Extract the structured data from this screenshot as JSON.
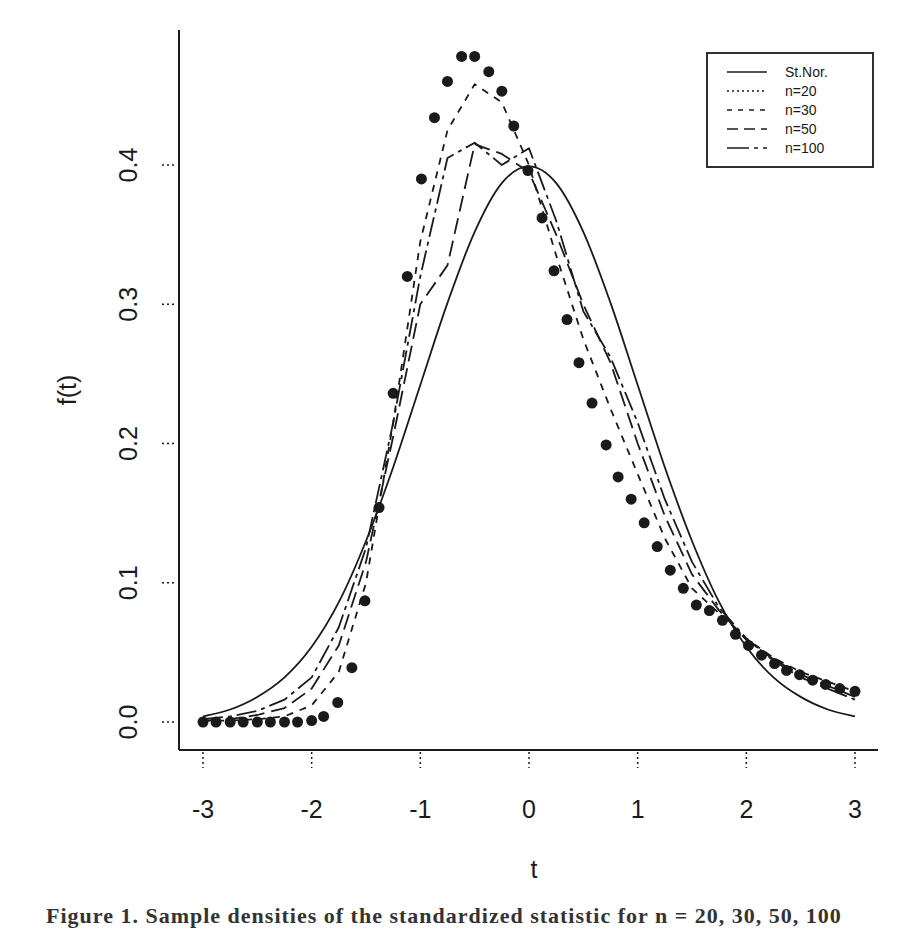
{
  "chart_data": {
    "type": "line",
    "title": "",
    "xlabel": "t",
    "ylabel": "f(t)",
    "xlim": [
      -3,
      3
    ],
    "ylim": [
      0.0,
      0.5
    ],
    "grid": false,
    "legend_position": "top-right",
    "x_ticks": [
      "-3",
      "-2",
      "-1",
      "0",
      "1",
      "2",
      "3"
    ],
    "y_ticks": [
      "0.0",
      "0.1",
      "0.2",
      "0.3",
      "0.4"
    ],
    "x": [
      -3.0,
      -2.75,
      -2.5,
      -2.25,
      -2.0,
      -1.75,
      -1.5,
      -1.25,
      -1.0,
      -0.75,
      -0.5,
      -0.25,
      0.0,
      0.25,
      0.5,
      0.75,
      1.0,
      1.25,
      1.5,
      1.75,
      2.0,
      2.25,
      2.5,
      2.75,
      3.0
    ],
    "series": [
      {
        "name": "St.Nor.",
        "style": "solid",
        "values": [
          0.004,
          0.009,
          0.018,
          0.032,
          0.054,
          0.086,
          0.13,
          0.183,
          0.242,
          0.301,
          0.352,
          0.387,
          0.399,
          0.387,
          0.352,
          0.301,
          0.242,
          0.183,
          0.13,
          0.086,
          0.054,
          0.032,
          0.018,
          0.009,
          0.004
        ]
      },
      {
        "name": "n=20",
        "style": "points",
        "x": [
          -3.0,
          -2.88,
          -2.75,
          -2.63,
          -2.5,
          -2.38,
          -2.25,
          -2.13,
          -2.0,
          -1.89,
          -1.76,
          -1.63,
          -1.51,
          -1.38,
          -1.25,
          -1.12,
          -0.99,
          -0.87,
          -0.75,
          -0.62,
          -0.5,
          -0.37,
          -0.25,
          -0.14,
          -0.01,
          0.12,
          0.23,
          0.35,
          0.46,
          0.58,
          0.71,
          0.82,
          0.94,
          1.06,
          1.18,
          1.3,
          1.42,
          1.54,
          1.66,
          1.78,
          1.9,
          2.02,
          2.14,
          2.26,
          2.37,
          2.49,
          2.61,
          2.73,
          2.86,
          3.0
        ],
        "values": [
          0.0,
          0.0,
          0.0,
          0.0,
          0.0,
          0.0,
          0.0,
          0.0,
          0.001,
          0.004,
          0.014,
          0.039,
          0.087,
          0.154,
          0.236,
          0.32,
          0.39,
          0.434,
          0.46,
          0.478,
          0.478,
          0.467,
          0.453,
          0.428,
          0.396,
          0.362,
          0.324,
          0.289,
          0.258,
          0.229,
          0.199,
          0.176,
          0.16,
          0.143,
          0.126,
          0.109,
          0.096,
          0.084,
          0.08,
          0.073,
          0.063,
          0.055,
          0.048,
          0.042,
          0.037,
          0.034,
          0.03,
          0.027,
          0.024,
          0.022
        ]
      },
      {
        "name": "n=30",
        "style": "short-dash",
        "values": [
          0.001,
          0.001,
          0.002,
          0.004,
          0.012,
          0.036,
          0.1,
          0.215,
          0.345,
          0.425,
          0.458,
          0.445,
          0.4,
          0.335,
          0.275,
          0.225,
          0.178,
          0.132,
          0.096,
          0.078,
          0.06,
          0.046,
          0.036,
          0.029,
          0.022
        ]
      },
      {
        "name": "n=50",
        "style": "long-dash",
        "values": [
          0.001,
          0.002,
          0.005,
          0.01,
          0.024,
          0.055,
          0.115,
          0.205,
          0.3,
          0.328,
          0.415,
          0.408,
          0.395,
          0.35,
          0.3,
          0.258,
          0.2,
          0.148,
          0.106,
          0.08,
          0.059,
          0.045,
          0.034,
          0.026,
          0.018
        ]
      },
      {
        "name": "n=100",
        "style": "dash-dot",
        "values": [
          0.002,
          0.004,
          0.008,
          0.016,
          0.032,
          0.068,
          0.125,
          0.215,
          0.32,
          0.405,
          0.416,
          0.4,
          0.412,
          0.36,
          0.295,
          0.262,
          0.215,
          0.16,
          0.115,
          0.082,
          0.06,
          0.044,
          0.032,
          0.024,
          0.016
        ]
      }
    ]
  },
  "axes": {
    "x_label": "t",
    "y_label": "f(t)",
    "x_ticks": [
      {
        "label": "-3",
        "value": -3
      },
      {
        "label": "-2",
        "value": -2
      },
      {
        "label": "-1",
        "value": -1
      },
      {
        "label": "0",
        "value": 0
      },
      {
        "label": "1",
        "value": 1
      },
      {
        "label": "2",
        "value": 2
      },
      {
        "label": "3",
        "value": 3
      }
    ],
    "y_ticks": [
      {
        "label": "0.0",
        "value": 0.0
      },
      {
        "label": "0.1",
        "value": 0.1
      },
      {
        "label": "0.2",
        "value": 0.2
      },
      {
        "label": "0.3",
        "value": 0.3
      },
      {
        "label": "0.4",
        "value": 0.4
      }
    ]
  },
  "legend": {
    "items": [
      {
        "label": "St.Nor.",
        "style": "solid"
      },
      {
        "label": "n=20",
        "style": "dotted"
      },
      {
        "label": "n=30",
        "style": "short-dash"
      },
      {
        "label": "n=50",
        "style": "long-dash"
      },
      {
        "label": "n=100",
        "style": "dash-dot"
      }
    ]
  },
  "colors": {
    "ink": "#1a1a1a",
    "background": "#ffffff"
  },
  "caption": {
    "text": "Figure 1.  Sample densities of the standardized statistic for n = 20, 30, 50, 100"
  }
}
